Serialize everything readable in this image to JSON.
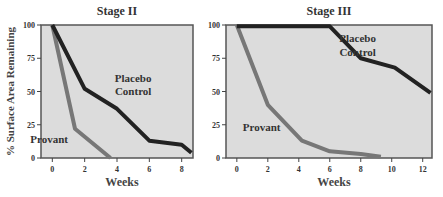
{
  "chart_data": [
    {
      "type": "line",
      "title": "Stage II",
      "xlabel": "Weeks",
      "ylabel": "% Surface Area Remaining",
      "xlim": [
        -0.7,
        8.7
      ],
      "ylim": [
        0,
        100
      ],
      "xticks": [
        0,
        2,
        4,
        6,
        8
      ],
      "yticks": [
        0,
        25,
        50,
        75,
        100
      ],
      "grid": false,
      "series": [
        {
          "name": "Placebo Control",
          "color": "#222222",
          "x": [
            0,
            2,
            4,
            6,
            8,
            8.6
          ],
          "y": [
            100,
            52,
            37,
            13,
            10,
            4
          ]
        },
        {
          "name": "Provant",
          "color": "#777777",
          "x": [
            0,
            1.4,
            3.6
          ],
          "y": [
            100,
            22,
            0
          ]
        }
      ],
      "annotations": [
        {
          "text": "Placebo",
          "x": 5.0,
          "y": 57
        },
        {
          "text": "Control",
          "x": 5.0,
          "y": 47
        },
        {
          "text": "Provant",
          "x": -0.2,
          "y": 11
        }
      ]
    },
    {
      "type": "line",
      "title": "Stage III",
      "xlabel": "Weeks",
      "ylabel": "",
      "xlim": [
        -0.7,
        12.6
      ],
      "ylim": [
        0,
        100
      ],
      "xticks": [
        0,
        2,
        4,
        6,
        8,
        10,
        12
      ],
      "yticks": [
        0,
        25,
        50,
        75,
        100
      ],
      "grid": false,
      "series": [
        {
          "name": "Placebo Control",
          "color": "#222222",
          "x": [
            0,
            6,
            8,
            10.2,
            12.5
          ],
          "y": [
            99,
            99,
            75,
            68,
            49
          ]
        },
        {
          "name": "Provant",
          "color": "#777777",
          "x": [
            0,
            2,
            4.2,
            6,
            8,
            9.3
          ],
          "y": [
            100,
            40,
            13,
            5,
            3,
            1
          ]
        }
      ],
      "annotations": [
        {
          "text": "Placebo",
          "x": 7.8,
          "y": 87
        },
        {
          "text": "Control",
          "x": 7.8,
          "y": 77
        },
        {
          "text": "Provant",
          "x": 1.6,
          "y": 20
        }
      ]
    }
  ]
}
